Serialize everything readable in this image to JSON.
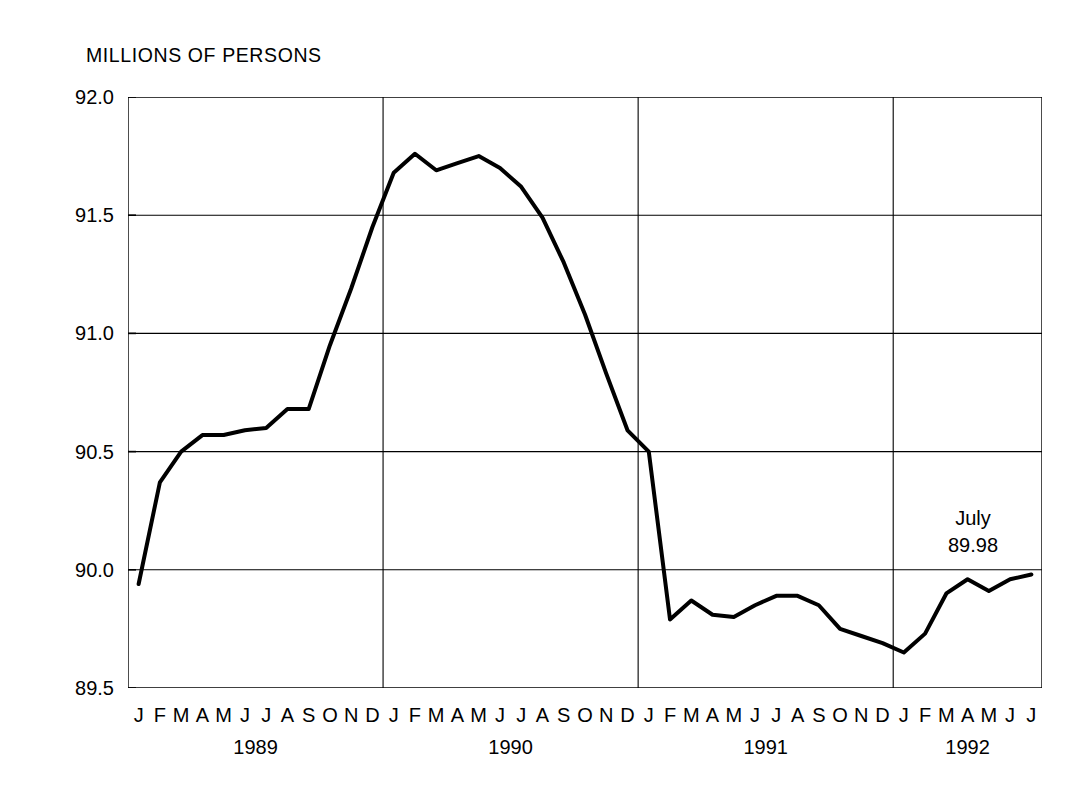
{
  "chart_data": {
    "type": "line",
    "title": "MILLIONS OF PERSONS",
    "xlabel": "",
    "ylabel": "MILLIONS OF PERSONS",
    "ylim": [
      89.5,
      92.0
    ],
    "y_ticks": [
      "89.5",
      "90.0",
      "90.5",
      "91.0",
      "91.5",
      "92.0"
    ],
    "y_tick_values": [
      89.5,
      90.0,
      90.5,
      91.0,
      91.5,
      92.0
    ],
    "grid": true,
    "grid_horizontal": true,
    "grid_vertical_year_dividers": true,
    "legend": "none",
    "line_color": "#000000",
    "line_width_px": 4,
    "month_labels": [
      "J",
      "F",
      "M",
      "A",
      "M",
      "J",
      "J",
      "A",
      "S",
      "O",
      "N",
      "D"
    ],
    "years": [
      {
        "label": "1989",
        "months": 12
      },
      {
        "label": "1990",
        "months": 12
      },
      {
        "label": "1991",
        "months": 12
      },
      {
        "label": "1992",
        "months": 7
      }
    ],
    "x": [
      "1989-01",
      "1989-02",
      "1989-03",
      "1989-04",
      "1989-05",
      "1989-06",
      "1989-07",
      "1989-08",
      "1989-09",
      "1989-10",
      "1989-11",
      "1989-12",
      "1990-01",
      "1990-02",
      "1990-03",
      "1990-04",
      "1990-05",
      "1990-06",
      "1990-07",
      "1990-08",
      "1990-09",
      "1990-10",
      "1990-11",
      "1990-12",
      "1991-01",
      "1991-02",
      "1991-03",
      "1991-04",
      "1991-05",
      "1991-06",
      "1991-07",
      "1991-08",
      "1991-09",
      "1991-10",
      "1991-11",
      "1991-12",
      "1992-01",
      "1992-02",
      "1992-03",
      "1992-04",
      "1992-05",
      "1992-06",
      "1992-07"
    ],
    "values": [
      89.94,
      90.37,
      90.5,
      90.57,
      90.57,
      90.59,
      90.6,
      90.68,
      90.68,
      90.95,
      91.19,
      91.45,
      91.68,
      91.76,
      91.69,
      91.72,
      91.75,
      91.7,
      91.62,
      91.49,
      91.3,
      91.08,
      90.83,
      90.59,
      90.5,
      89.79,
      89.87,
      89.81,
      89.8,
      89.85,
      89.89,
      89.89,
      89.85,
      89.75,
      89.72,
      89.69,
      89.65,
      89.73,
      89.9,
      89.96,
      89.91,
      89.96,
      89.98
    ],
    "annotation": {
      "label": "July",
      "value": "89.98"
    }
  }
}
